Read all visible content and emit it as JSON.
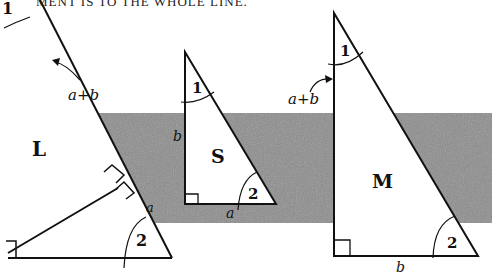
{
  "caption": "MENT IS TO THE WHOLE LINE.",
  "colors": {
    "band": "#8a8a8a",
    "line": "#111111",
    "background": "#ffffff"
  },
  "triangles": {
    "L": {
      "label": "L",
      "angle_top": "1",
      "angle_bottom": "2",
      "side_label_top": "a+b",
      "side_label_bottom": "a"
    },
    "S": {
      "label": "S",
      "angle_top": "1",
      "angle_bottom": "2",
      "side_vertical": "b",
      "side_base": "a"
    },
    "M": {
      "label": "M",
      "angle_top": "1",
      "angle_bottom": "2",
      "side_vertical": "a+b",
      "side_base": "b"
    }
  }
}
